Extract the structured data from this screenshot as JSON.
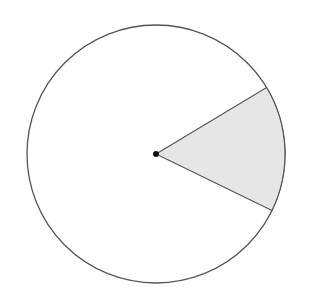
{
  "diagram": {
    "type": "circle-sector",
    "circle": {
      "cx": 156,
      "cy": 154,
      "r": 129,
      "stroke": "#555555",
      "fill": "#ffffff"
    },
    "sector": {
      "start_angle_deg": -31,
      "end_angle_deg": 26,
      "fill": "#e6e6e6",
      "stroke": "#555555"
    },
    "center_point": {
      "cx": 156,
      "cy": 154,
      "r": 3,
      "fill": "#111111"
    }
  }
}
